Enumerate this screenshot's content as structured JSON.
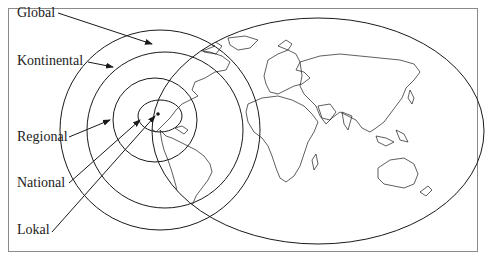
{
  "figure": {
    "labels": [
      {
        "id": "global",
        "text": "Global"
      },
      {
        "id": "kontinental",
        "text": "Kontinental"
      },
      {
        "id": "regional",
        "text": "Regional"
      },
      {
        "id": "national",
        "text": "National"
      },
      {
        "id": "lokal",
        "text": "Lokal"
      }
    ],
    "colors": {
      "line": "#1a1a1a",
      "frame": "#8a8a8a",
      "background": "#ffffff"
    }
  }
}
